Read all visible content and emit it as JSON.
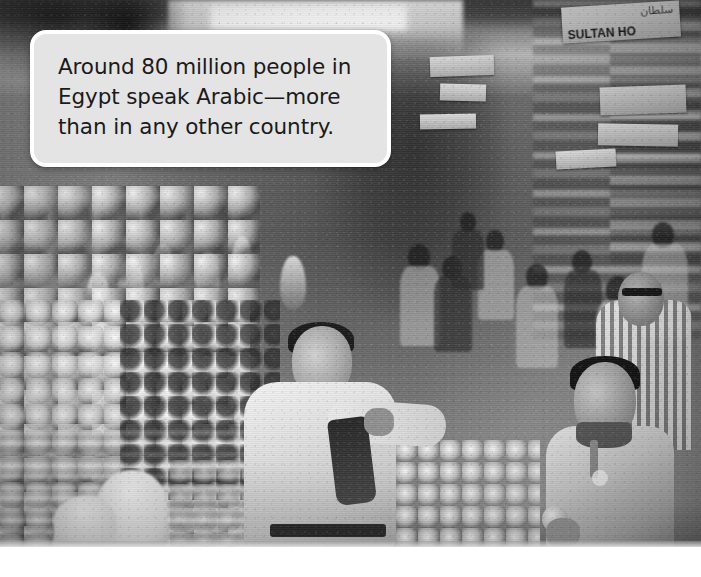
{
  "page": {
    "type": "photo-with-caption-callout",
    "background_color": "#ffffff"
  },
  "photo": {
    "name": "egyptian-street-market-photo",
    "description": "Black and white photograph of a crowded outdoor fruit and vegetable market street in Egypt",
    "treatment": "grayscale",
    "width_px": 701,
    "height_px": 547,
    "signage": {
      "shop_sign_latin": "SULTAN HO",
      "shop_sign_arabic": "سلطان"
    },
    "subjects": [
      "market-vendor-center",
      "young-man-right-foreground",
      "man-striped-shirt-right",
      "crowd-background",
      "fruit-stall-left",
      "produce-crates",
      "hanging-pineapples",
      "shop-fronts-right"
    ]
  },
  "callout": {
    "name": "caption-callout",
    "text": "Around 80 million people in\nEgypt speak Arabic—more\nthan in any other country.",
    "line_1": "Around 80 million people in",
    "line_2": "Egypt speak Arabic—more",
    "line_3": "than in any other country.",
    "fact_number": "80 million",
    "country": "Egypt",
    "language": "Arabic",
    "fill_color": "#e4e4e4",
    "border_color": "#ffffff",
    "text_color": "#1a1a1a"
  }
}
